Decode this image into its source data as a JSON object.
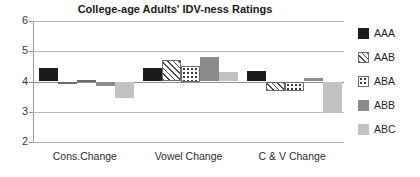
{
  "chart_data": {
    "type": "bar",
    "title": "College-age Adults' IDV-ness Ratings",
    "xlabel": "",
    "ylabel": "",
    "ylim": [
      2,
      6
    ],
    "yticks": [
      "2",
      "3",
      "4",
      "5",
      "6"
    ],
    "grid": true,
    "legend_position": "right",
    "baseline": 4,
    "categories": [
      "Cons.Change",
      "Vowel Change",
      "C & V Change"
    ],
    "series": [
      {
        "name": "AAA",
        "pattern": "solid-black",
        "color": "#1c1c1c",
        "values": [
          4.45,
          4.45,
          4.35
        ]
      },
      {
        "name": "AAB",
        "pattern": "diagonal-hatch",
        "color": "#ffffff",
        "values": [
          3.98,
          4.7,
          3.7
        ]
      },
      {
        "name": "ABA",
        "pattern": "dotted",
        "color": "#ffffff",
        "values": [
          4.05,
          4.5,
          3.7
        ]
      },
      {
        "name": "ABB",
        "pattern": "solid-dark-gray",
        "color": "#8b8b8b",
        "values": [
          3.85,
          4.8,
          4.1
        ]
      },
      {
        "name": "ABC",
        "pattern": "solid-light-gray",
        "color": "#c2c2c2",
        "values": [
          3.45,
          4.3,
          2.95
        ]
      }
    ]
  },
  "axis": {
    "y_tick_labels": [
      "6",
      "5",
      "4",
      "3",
      "2"
    ]
  },
  "legend": {
    "items": [
      {
        "label": "AAA"
      },
      {
        "label": "AAB"
      },
      {
        "label": "ABA"
      },
      {
        "label": "ABB"
      },
      {
        "label": "ABC"
      }
    ]
  }
}
